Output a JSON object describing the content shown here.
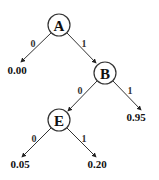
{
  "diagram": {
    "type": "binary decision tree",
    "nodes": [
      {
        "id": "A",
        "label": "A",
        "cx": 59,
        "cy": 25
      },
      {
        "id": "B",
        "label": "B",
        "cx": 105,
        "cy": 73
      },
      {
        "id": "E",
        "label": "E",
        "cx": 59,
        "cy": 120
      }
    ],
    "leaves": [
      {
        "id": "leaf-A0",
        "label": "0.00",
        "x": 17,
        "y": 74
      },
      {
        "id": "leaf-B1",
        "label": "0.95",
        "x": 136,
        "y": 121
      },
      {
        "id": "leaf-E0",
        "label": "0.05",
        "x": 20,
        "y": 168
      },
      {
        "id": "leaf-E1",
        "label": "0.20",
        "x": 97,
        "y": 168
      }
    ],
    "edges": [
      {
        "from": "A",
        "to": "leaf-A0",
        "label": "0"
      },
      {
        "from": "A",
        "to": "B",
        "label": "1"
      },
      {
        "from": "B",
        "to": "E",
        "label": "0"
      },
      {
        "from": "B",
        "to": "leaf-B1",
        "label": "1"
      },
      {
        "from": "E",
        "to": "leaf-E0",
        "label": "0"
      },
      {
        "from": "E",
        "to": "leaf-E1",
        "label": "1"
      }
    ]
  }
}
